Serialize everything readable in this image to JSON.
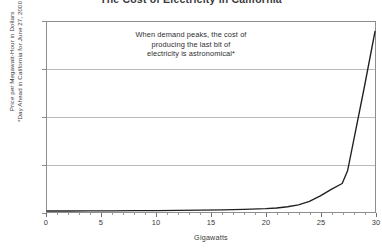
{
  "chart_data": {
    "type": "line",
    "title": "The Cost of Electricity in California",
    "xlabel": "Gigawatts",
    "ylabel_lines": [
      "Price per Megawatt-Hour in Dollars",
      "*Day Ahead in California for June 27, 2000"
    ],
    "xlim": [
      0,
      30
    ],
    "ylim": [
      0,
      800
    ],
    "x_ticks": [
      0,
      5,
      10,
      15,
      20,
      25,
      30
    ],
    "x_tick_labels": [
      "0",
      "5",
      "10",
      "15",
      "20",
      "25",
      "30"
    ],
    "x_minor_tick_step": 1,
    "y_ticks": [
      0,
      200,
      400,
      600,
      800
    ],
    "y_tick_labels": [
      "0",
      "200",
      "400",
      "600",
      "800"
    ],
    "grid": "horizontal",
    "legend": "none",
    "line_color": "#231f20",
    "series": [
      {
        "name": "Day-ahead electricity price",
        "x": [
          0,
          2,
          4,
          6,
          8,
          10,
          12,
          14,
          16,
          18,
          20,
          21,
          22,
          23,
          24,
          25,
          26,
          27,
          27.5,
          28,
          29,
          30
        ],
        "values": [
          4,
          4,
          5,
          5,
          6,
          6,
          7,
          8,
          9,
          11,
          14,
          17,
          22,
          30,
          45,
          68,
          95,
          120,
          175,
          290,
          520,
          760
        ]
      }
    ],
    "annotations": [
      {
        "lines": [
          "When demand peaks, the cost of",
          "producing the last bit of",
          "electricity is astronomical*"
        ]
      }
    ]
  }
}
